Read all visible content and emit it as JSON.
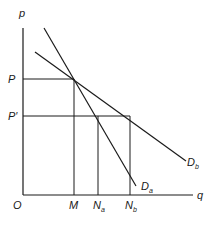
{
  "diagram": {
    "type": "supply-demand-price-quantity",
    "axes": {
      "y_label": "p",
      "x_label": "q",
      "origin_label": "O"
    },
    "price_levels": [
      {
        "id": "P",
        "label": "P"
      },
      {
        "id": "P_prime",
        "label": "P′"
      }
    ],
    "quantity_levels": [
      {
        "id": "M",
        "label": "M",
        "sub": ""
      },
      {
        "id": "Na",
        "label": "N",
        "sub": "a"
      },
      {
        "id": "Nb",
        "label": "N",
        "sub": "b"
      }
    ],
    "curves": [
      {
        "id": "Da",
        "label": "D",
        "sub": "a",
        "description": "steeper demand curve"
      },
      {
        "id": "Db",
        "label": "D",
        "sub": "b",
        "description": "flatter demand curve"
      }
    ],
    "relationships": [
      "Da and Db intersect at price P, quantity M",
      "At price P′, Da gives quantity Na",
      "At price P′, Db gives quantity Nb"
    ],
    "line_color": "#1a1a1a"
  }
}
